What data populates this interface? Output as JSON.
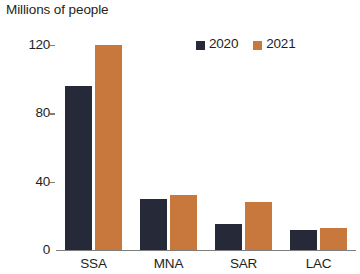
{
  "chart_data": {
    "type": "bar",
    "title": "Millions of people",
    "subtitle": "",
    "xlabel": "",
    "ylabel": "",
    "categories": [
      "SSA",
      "MNA",
      "SAR",
      "LAC"
    ],
    "series": [
      {
        "name": "2020",
        "color": "#262938",
        "values": [
          96,
          30,
          15,
          12
        ]
      },
      {
        "name": "2021",
        "color": "#c8783c",
        "values": [
          120,
          32,
          28,
          13
        ]
      }
    ],
    "ylim": [
      0,
      120
    ],
    "yticks": [
      0,
      40,
      80,
      120
    ],
    "ytick_labels": [
      "0",
      "40",
      "80",
      "120"
    ],
    "grid": false,
    "legend_position": "top-right",
    "axis_color": "#7d7d7d"
  },
  "legend": {
    "items": [
      {
        "label": "2020",
        "swatch": "legend-swatch-2020"
      },
      {
        "label": "2021",
        "swatch": "legend-swatch-2021"
      }
    ]
  }
}
